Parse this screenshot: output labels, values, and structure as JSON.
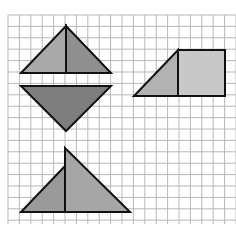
{
  "figure": {
    "grid": {
      "x0": 8,
      "y0": 15,
      "x1": 236,
      "y1": 224,
      "cell": 11.4,
      "line_color": "#b8b8b8",
      "background": "#ffffff"
    },
    "shapes": [
      {
        "name": "upright-triangle",
        "parts": [
          {
            "name": "left-half",
            "points": "21,73 66,26 66,73",
            "fill": "#a9a9a9"
          },
          {
            "name": "right-half",
            "points": "66,26 111,73 66,73",
            "fill": "#8f8f8f"
          }
        ]
      },
      {
        "name": "inverted-triangle",
        "parts": [
          {
            "name": "whole",
            "points": "21,86 111,86 66,131",
            "fill": "#7e7e7e"
          }
        ]
      },
      {
        "name": "trapezoid",
        "parts": [
          {
            "name": "triangle",
            "points": "134,96 178,50 178,96",
            "fill": "#b2b2b2"
          },
          {
            "name": "rectangle",
            "points": "178,50 225,50 225,96 178,96",
            "fill": "#c8c8c8"
          }
        ]
      },
      {
        "name": "composite-triangles",
        "parts": [
          {
            "name": "small-left-triangle",
            "points": "21,212 65,166 65,212",
            "fill": "#9a9a9a"
          },
          {
            "name": "tall-right-triangle",
            "points": "65,148 130,212 65,212",
            "fill": "#a6a6a6"
          }
        ]
      }
    ],
    "stroke_color": "#111111",
    "stroke_width": 2
  }
}
